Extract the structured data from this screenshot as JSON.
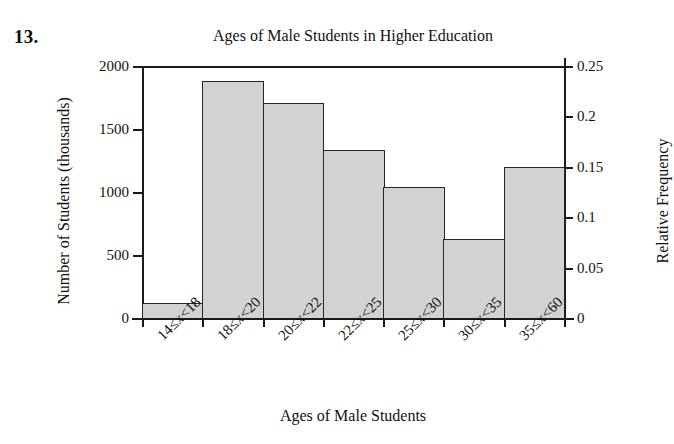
{
  "problem_number": "13.",
  "chart_data": {
    "type": "bar",
    "title": "Ages of Male Students in Higher Education",
    "xlabel": "Ages of Male Students",
    "ylabel": "Number of Students (thousands)",
    "ylabel_secondary": "Relative Frequency",
    "categories": [
      "14≤x<18",
      "18≤x<20",
      "20≤x<22",
      "22≤x<25",
      "25≤x<30",
      "30≤x<35",
      "35≤x<60"
    ],
    "values": [
      120,
      1880,
      1710,
      1330,
      1040,
      630,
      1200
    ],
    "relative_frequency": [
      0.015,
      0.235,
      0.214,
      0.166,
      0.13,
      0.079,
      0.15
    ],
    "ylim": [
      0,
      2000
    ],
    "ylim_secondary": [
      0,
      0.25
    ],
    "yticks": [
      0,
      500,
      1000,
      1500,
      2000
    ],
    "ytick_labels": [
      "0",
      "500",
      "1000",
      "1500",
      "2000"
    ],
    "yticks_secondary": [
      0,
      0.05,
      0.1,
      0.15,
      0.2,
      0.25
    ],
    "ytick_labels_secondary": [
      "0",
      "0.05",
      "0.1",
      "0.15",
      "0.2",
      "0.25"
    ],
    "grid": false,
    "legend": null,
    "bar_fill_color": "#d2d2d2",
    "bar_edge_color": "#262626"
  }
}
